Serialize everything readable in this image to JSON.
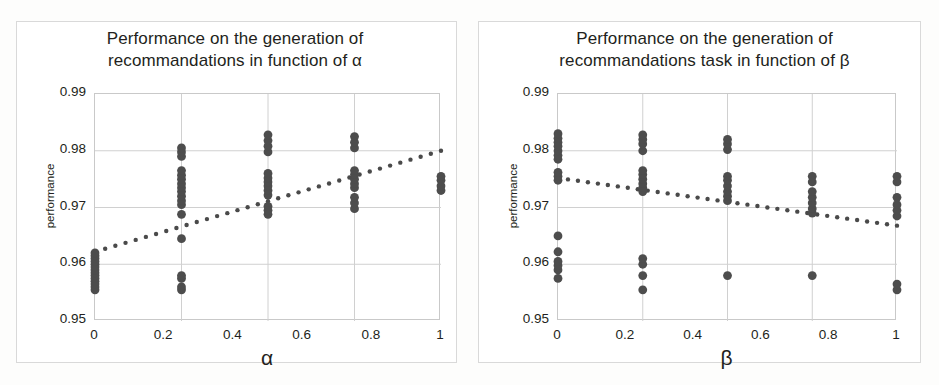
{
  "figure": {
    "background_color": "#fdfdfc",
    "frame_color": "#d9d9d9",
    "marker_color": "#4d4d4d",
    "trendline_color": "#4a4a4a",
    "gridline_color": "#d0d0d0"
  },
  "panels": [
    {
      "id": "alpha",
      "title": "Performance  on the generation of\nrecommandations in function of α",
      "xlabel": "α",
      "ylabel": "performance",
      "xticks": [
        "0",
        "0.2",
        "0.4",
        "0.6",
        "0.8",
        "1"
      ],
      "yticks": [
        "0.99",
        "0.98",
        "0.97",
        "0.96",
        "0.95"
      ]
    },
    {
      "id": "beta",
      "title": "Performance  on the generation of\nrecommandations task in function of β",
      "xlabel": "β",
      "ylabel": "performance",
      "xticks": [
        "0",
        "0.2",
        "0.4",
        "0.6",
        "0.8",
        "1"
      ],
      "yticks": [
        "0.99",
        "0.98",
        "0.97",
        "0.96",
        "0.95"
      ]
    }
  ],
  "chart_data": [
    {
      "type": "scatter",
      "id": "alpha",
      "title": "Performance on the generation of recommandations in function of α",
      "xlabel": "α",
      "ylabel": "performance",
      "xlim": [
        0,
        1
      ],
      "ylim": [
        0.95,
        0.99
      ],
      "xticks": [
        0,
        0.2,
        0.4,
        0.6,
        0.8,
        1
      ],
      "yticks": [
        0.95,
        0.96,
        0.97,
        0.98,
        0.99
      ],
      "grid": true,
      "legend": "none",
      "series": [
        {
          "name": "performance samples",
          "marker": "circle",
          "points": [
            [
              0,
              0.9555
            ],
            [
              0,
              0.956
            ],
            [
              0,
              0.9565
            ],
            [
              0,
              0.957
            ],
            [
              0,
              0.9575
            ],
            [
              0,
              0.958
            ],
            [
              0,
              0.9585
            ],
            [
              0,
              0.959
            ],
            [
              0,
              0.9595
            ],
            [
              0,
              0.96
            ],
            [
              0,
              0.9605
            ],
            [
              0,
              0.961
            ],
            [
              0,
              0.9615
            ],
            [
              0,
              0.962
            ],
            [
              0.25,
              0.9555
            ],
            [
              0.25,
              0.956
            ],
            [
              0.25,
              0.9575
            ],
            [
              0.25,
              0.958
            ],
            [
              0.25,
              0.9645
            ],
            [
              0.25,
              0.9688
            ],
            [
              0.25,
              0.9705
            ],
            [
              0.25,
              0.9712
            ],
            [
              0.25,
              0.972
            ],
            [
              0.25,
              0.9728
            ],
            [
              0.25,
              0.9735
            ],
            [
              0.25,
              0.9742
            ],
            [
              0.25,
              0.975
            ],
            [
              0.25,
              0.9757
            ],
            [
              0.25,
              0.9765
            ],
            [
              0.25,
              0.979
            ],
            [
              0.25,
              0.9798
            ],
            [
              0.25,
              0.9805
            ],
            [
              0.5,
              0.9688
            ],
            [
              0.5,
              0.9695
            ],
            [
              0.5,
              0.9702
            ],
            [
              0.5,
              0.9722
            ],
            [
              0.5,
              0.973
            ],
            [
              0.5,
              0.9738
            ],
            [
              0.5,
              0.9745
            ],
            [
              0.5,
              0.9752
            ],
            [
              0.5,
              0.976
            ],
            [
              0.5,
              0.9798
            ],
            [
              0.5,
              0.9808
            ],
            [
              0.5,
              0.9818
            ],
            [
              0.5,
              0.9828
            ],
            [
              0.75,
              0.9698
            ],
            [
              0.75,
              0.9708
            ],
            [
              0.75,
              0.9718
            ],
            [
              0.75,
              0.9735
            ],
            [
              0.75,
              0.9742
            ],
            [
              0.75,
              0.975
            ],
            [
              0.75,
              0.9758
            ],
            [
              0.75,
              0.9765
            ],
            [
              0.75,
              0.9805
            ],
            [
              0.75,
              0.9815
            ],
            [
              0.75,
              0.9825
            ],
            [
              1,
              0.973
            ],
            [
              1,
              0.9738
            ],
            [
              1,
              0.9748
            ],
            [
              1,
              0.9755
            ]
          ]
        }
      ],
      "trendline": {
        "style": "dotted",
        "x": [
          0,
          1
        ],
        "y": [
          0.9622,
          0.98
        ]
      }
    },
    {
      "type": "scatter",
      "id": "beta",
      "title": "Performance on the generation of recommandations task in function of β",
      "xlabel": "β",
      "ylabel": "performance",
      "xlim": [
        0,
        1
      ],
      "ylim": [
        0.95,
        0.99
      ],
      "xticks": [
        0,
        0.2,
        0.4,
        0.6,
        0.8,
        1
      ],
      "yticks": [
        0.95,
        0.96,
        0.97,
        0.98,
        0.99
      ],
      "grid": true,
      "legend": "none",
      "series": [
        {
          "name": "performance samples",
          "marker": "circle",
          "points": [
            [
              0,
              0.9575
            ],
            [
              0,
              0.959
            ],
            [
              0,
              0.9598
            ],
            [
              0,
              0.9605
            ],
            [
              0,
              0.9622
            ],
            [
              0,
              0.965
            ],
            [
              0,
              0.9748
            ],
            [
              0,
              0.9755
            ],
            [
              0,
              0.9762
            ],
            [
              0,
              0.9785
            ],
            [
              0,
              0.9792
            ],
            [
              0,
              0.98
            ],
            [
              0,
              0.9808
            ],
            [
              0,
              0.9815
            ],
            [
              0,
              0.9822
            ],
            [
              0,
              0.983
            ],
            [
              0.25,
              0.9555
            ],
            [
              0.25,
              0.958
            ],
            [
              0.25,
              0.96
            ],
            [
              0.25,
              0.961
            ],
            [
              0.25,
              0.9728
            ],
            [
              0.25,
              0.9735
            ],
            [
              0.25,
              0.9742
            ],
            [
              0.25,
              0.975
            ],
            [
              0.25,
              0.9758
            ],
            [
              0.25,
              0.9765
            ],
            [
              0.25,
              0.98
            ],
            [
              0.25,
              0.9812
            ],
            [
              0.25,
              0.982
            ],
            [
              0.25,
              0.9828
            ],
            [
              0.5,
              0.958
            ],
            [
              0.5,
              0.9712
            ],
            [
              0.5,
              0.972
            ],
            [
              0.5,
              0.9728
            ],
            [
              0.5,
              0.9738
            ],
            [
              0.5,
              0.9748
            ],
            [
              0.5,
              0.9755
            ],
            [
              0.5,
              0.9802
            ],
            [
              0.5,
              0.9812
            ],
            [
              0.5,
              0.982
            ],
            [
              0.75,
              0.958
            ],
            [
              0.75,
              0.969
            ],
            [
              0.75,
              0.9698
            ],
            [
              0.75,
              0.9708
            ],
            [
              0.75,
              0.9718
            ],
            [
              0.75,
              0.9728
            ],
            [
              0.75,
              0.9745
            ],
            [
              0.75,
              0.9755
            ],
            [
              1,
              0.9555
            ],
            [
              1,
              0.9565
            ],
            [
              1,
              0.9685
            ],
            [
              1,
              0.9695
            ],
            [
              1,
              0.9705
            ],
            [
              1,
              0.9718
            ],
            [
              1,
              0.9745
            ],
            [
              1,
              0.9755
            ]
          ]
        }
      ],
      "trendline": {
        "style": "dotted",
        "x": [
          0,
          1
        ],
        "y": [
          0.9752,
          0.9668
        ]
      }
    }
  ]
}
